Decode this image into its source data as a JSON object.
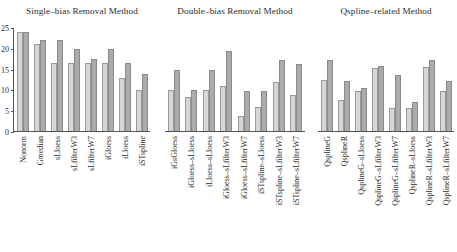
{
  "chart_data": {
    "type": "bar",
    "title": "",
    "xlabel": "",
    "ylabel": "",
    "ylim": [
      0,
      25
    ],
    "yticks": [
      0,
      5,
      10,
      15,
      20,
      25
    ],
    "ytick_labels": [
      "0",
      "5",
      "10",
      "15",
      "20",
      "25"
    ],
    "grid": false,
    "legend": "none",
    "series": [
      {
        "name": "light",
        "color": "#d6d6d6"
      },
      {
        "name": "dark",
        "color": "#ababab"
      }
    ],
    "panels": [
      {
        "title": "Single–bias Removal Method",
        "categories": [
          "Nonorm",
          "Gmedian",
          "sLloess",
          "sLfilterW3",
          "sLfilterW7",
          "iGloess",
          "iLloess",
          "iSTspline"
        ],
        "series": [
          {
            "name": "light",
            "values": [
              24.1,
              21.1,
              16.5,
              16.5,
              16.5,
              16.5,
              13.1,
              10.1
            ]
          },
          {
            "name": "dark",
            "values": [
              24.1,
              22.1,
              22.1,
              20.0,
              17.5,
              20.0,
              16.5,
              14.0
            ]
          }
        ]
      },
      {
        "title": "Double–bias Removal Method",
        "categories": [
          "iGsGloess",
          "iGloess–sLloess",
          "iLloess–sLloess",
          "iGloess–sLfilterW3",
          "iGloess–sLfilterW7",
          "iSTspline–sLloess",
          "iSTspline–sLfilterW3",
          "iSTspline–sLfilterW7"
        ],
        "series": [
          {
            "name": "light",
            "values": [
              10.0,
              8.4,
              10.0,
              11.0,
              3.9,
              5.9,
              12.0,
              8.9
            ]
          },
          {
            "name": "dark",
            "values": [
              15.0,
              10.0,
              15.0,
              19.4,
              9.9,
              9.9,
              17.4,
              16.3
            ]
          }
        ]
      },
      {
        "title": "Qspline–related Method",
        "categories": [
          "QsplineG",
          "QsplineR",
          "QsplineG–sLloess",
          "QsplineG–sLfilterW3",
          "QsplineG–sLfilterW7",
          "QsplineR–sLloess",
          "QsplineR–sLfilterW3",
          "QsplineR–sLfilterW7"
        ],
        "series": [
          {
            "name": "light",
            "values": [
              12.4,
              7.8,
              9.8,
              15.3,
              5.7,
              5.7,
              15.7,
              9.8
            ]
          },
          {
            "name": "dark",
            "values": [
              17.3,
              12.3,
              10.7,
              15.8,
              13.8,
              7.3,
              17.2,
              12.2
            ]
          }
        ]
      }
    ]
  }
}
